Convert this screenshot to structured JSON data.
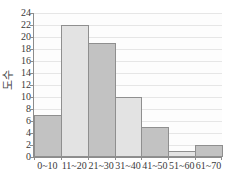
{
  "chart_data": {
    "type": "bar",
    "title": "",
    "subtitle": "",
    "xlabel": "",
    "ylabel": "도수",
    "categories": [
      "0~10",
      "11~20",
      "21~30",
      "31~40",
      "41~50",
      "51~60",
      "61~70"
    ],
    "values": [
      7,
      22,
      19,
      10,
      5,
      1,
      2
    ],
    "ylim": [
      0,
      24
    ],
    "ytick_labels": [
      "0",
      "2",
      "4",
      "6",
      "8",
      "10",
      "12",
      "14",
      "16",
      "18",
      "20",
      "22",
      "24"
    ],
    "ytick_values": [
      0,
      2,
      4,
      6,
      8,
      10,
      12,
      14,
      16,
      18,
      20,
      22,
      24
    ],
    "grid": true,
    "grid_axis": "y",
    "legend": false,
    "legend_position": "none",
    "bar_fills": [
      "dark",
      "light",
      "dark",
      "light",
      "dark",
      "light",
      "dark"
    ],
    "colors": {
      "bar_dark": "#c2c2c2",
      "bar_light": "#e3e3e3",
      "bar_edge": "#8f8f8f",
      "gridline": "#e6e6e6",
      "axis": "#8c8c8c",
      "text": "#3a3a3a",
      "plot_background": "#fdfdfd"
    }
  }
}
